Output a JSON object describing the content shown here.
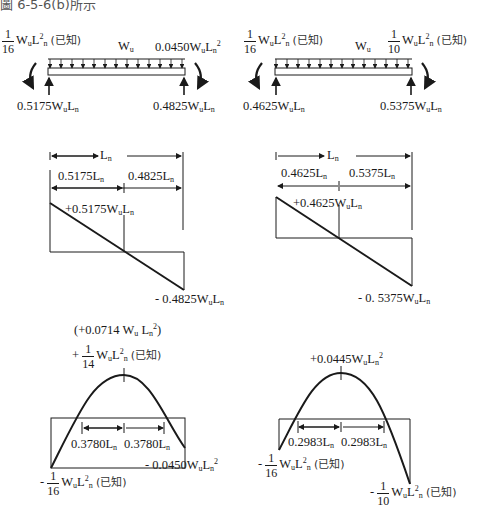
{
  "header": "圖 6-5-6(b)所示",
  "known_tag": "(已知)",
  "left_case": {
    "beam": {
      "left_moment": {
        "num": "1",
        "den": "16",
        "expr": "W",
        "sub": "u",
        "L": "L",
        "Lsub": "n",
        "pow": "2"
      },
      "load_label": {
        "W": "W",
        "sub": "u"
      },
      "right_moment": {
        "text": "0.0450W",
        "sub": "u",
        "L": "L",
        "Lsub": "n",
        "pow": "2"
      },
      "left_reaction": {
        "text": "0.5175W",
        "sub": "u",
        "L": "L",
        "Lsub": "n"
      },
      "right_reaction": {
        "text": "0.4825W",
        "sub": "u",
        "L": "L",
        "Lsub": "n"
      }
    },
    "shear": {
      "span": {
        "L": "L",
        "sub": "n"
      },
      "left_seg": "0.5175L",
      "right_seg": "0.4825L",
      "seg_sub": "n",
      "pos_label": "+0.5175W",
      "neg_label": "- 0.4825W",
      "sub_u": "u",
      "L": "L",
      "sub_n": "n"
    },
    "moment": {
      "max_paren": "(+0.0714 W",
      "max_paren_tail": ")",
      "max_frac": {
        "sign": "+",
        "num": "1",
        "den": "14"
      },
      "inflection_left": "0.3780L",
      "inflection_right": "0.3780L",
      "left_end": {
        "sign": "-",
        "num": "1",
        "den": "16"
      },
      "right_end": "- 0.0450W"
    }
  },
  "right_case": {
    "beam": {
      "left_moment": {
        "num": "1",
        "den": "16"
      },
      "load_label": {
        "W": "W",
        "sub": "u"
      },
      "right_moment": {
        "num": "1",
        "den": "10"
      },
      "left_reaction": {
        "text": "0.4625W"
      },
      "right_reaction": {
        "text": "0.5375W"
      }
    },
    "shear": {
      "left_seg": "0.4625L",
      "right_seg": "0.5375L",
      "pos_label": "+0.4625W",
      "neg_label": "- 0. 5375W"
    },
    "moment": {
      "max_label": "+0.0445W",
      "inflection_left": "0.2983L",
      "inflection_right": "0.2983L",
      "left_end": {
        "sign": "-",
        "num": "1",
        "den": "16"
      },
      "right_end": {
        "sign": "-",
        "num": "1",
        "den": "10"
      }
    }
  },
  "colors": {
    "ink": "#1a1a1a",
    "background": "#ffffff"
  }
}
